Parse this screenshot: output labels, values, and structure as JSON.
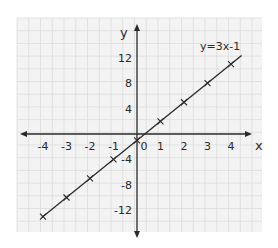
{
  "chart_data": {
    "type": "line",
    "title": "",
    "xlabel": "x",
    "ylabel": "y",
    "xlim": [
      -4.5,
      4.8
    ],
    "ylim": [
      -16,
      16
    ],
    "grid": true,
    "x_ticks": [
      "-4",
      "-3",
      "-2",
      "-1",
      "0",
      "1",
      "2",
      "3",
      "4"
    ],
    "y_ticks": [
      "12",
      "8",
      "4",
      "-4",
      "-8",
      "-12"
    ],
    "series": [
      {
        "name": "y=3x-1",
        "x": [
          -4,
          -3,
          -2,
          -1,
          0,
          1,
          2,
          3,
          4
        ],
        "y": [
          -13,
          -10,
          -7,
          -4,
          -1,
          2,
          5,
          8,
          11
        ],
        "marker": "x",
        "color": "#2a2a2a"
      }
    ],
    "annotations": [
      {
        "text": "y=3x-1",
        "x": 3.7,
        "y": 14.5
      }
    ],
    "colors": {
      "grid": "#dcdcdc",
      "background": "#f3f3f3",
      "axis": "#2a2a2a"
    }
  }
}
